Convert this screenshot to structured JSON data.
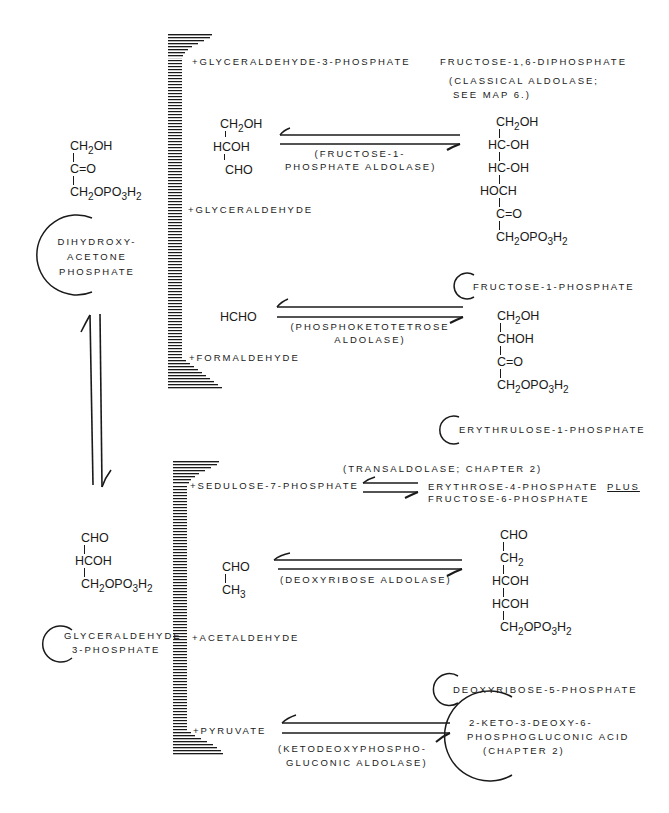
{
  "diagram": {
    "type": "reaction-map"
  },
  "left_compounds": {
    "dhap": {
      "formula_lines": [
        "CH2OH",
        "C=O",
        "CH2OPO3H2"
      ],
      "name_lines": [
        "Dihydroxy-",
        "acetone",
        "Phosphate"
      ]
    },
    "g3p": {
      "formula_lines": [
        "CHO",
        "HCOH",
        "CH2OPO3H2"
      ],
      "name_lines": [
        "Glyceraldehyde",
        "3-Phosphate"
      ]
    }
  },
  "upper_group": {
    "bracket_items": [
      "+Glyceraldehyde-3-phosphate",
      "+Glyceraldehyde",
      "+Formaldehyde"
    ],
    "reactions": [
      {
        "product_name": "Fructose-1,6-diphosphate",
        "enzyme_lines": [
          "(classical aldolase;",
          "see map 6.)"
        ]
      },
      {
        "substrate_formula_lines": [
          "CH2OH",
          "HCOH",
          "CHO"
        ],
        "enzyme_lines": [
          "(Fructose-1-",
          "phosphate aldolase)"
        ],
        "product_formula_lines": [
          "CH2OH",
          "HC-OH",
          "HC-OH",
          "HOCH",
          "C=O",
          "CH2OPO3H2"
        ],
        "product_name": "Fructose-1-phosphate"
      },
      {
        "substrate_formula_lines": [
          "HCHO"
        ],
        "enzyme_lines": [
          "(phosphoketotetrose",
          "aldolase)"
        ],
        "product_formula_lines": [
          "CH2OH",
          "CHOH",
          "C=O",
          "CH2OPO3H2"
        ],
        "product_name": "Erythrulose-1-phosphate"
      }
    ]
  },
  "lower_group": {
    "bracket_items": [
      "+Sedulose-7-phosphate",
      "+Acetaldehyde",
      "+Pyruvate"
    ],
    "reactions": [
      {
        "enzyme_lines": [
          "(transaldolase; Chapter 2)"
        ],
        "product_lines": [
          "Erythrose-4-phosphate",
          "Fructose-6-phosphate"
        ],
        "product_conjunction": "plus"
      },
      {
        "substrate_formula_lines": [
          "CHO",
          "CH3"
        ],
        "enzyme_lines": [
          "(Deoxyribose aldolase)"
        ],
        "product_formula_lines": [
          "CHO",
          "CH2",
          "HCOH",
          "HCOH",
          "CH2OPO3H2"
        ],
        "product_name": "Deoxyribose-5-phosphate"
      },
      {
        "enzyme_lines": [
          "(Ketodeoxyphospho-",
          "gluconic aldolase)"
        ],
        "product_name_lines": [
          "2-Keto-3-deoxy-6-",
          "phosphogluconic acid",
          "(Chapter 2)"
        ]
      }
    ]
  },
  "colors": {
    "ink": "#1a1a1a",
    "background": "#ffffff"
  }
}
